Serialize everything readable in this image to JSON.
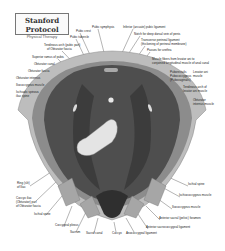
{
  "title": {
    "main": "Stanford Protocol",
    "sub": "Physical Therapy"
  },
  "labels": {
    "top": [
      {
        "text": "Pubic symphysis",
        "x": 92,
        "y": 27
      },
      {
        "text": "Inferior (arcuate) pubic ligament",
        "x": 123,
        "y": 27
      },
      {
        "text": "Pubic crest",
        "x": 76,
        "y": 31
      },
      {
        "text": "Pubic tubercle",
        "x": 70,
        "y": 37
      },
      {
        "text": "Notch for deep dorsal vein of penis",
        "x": 134,
        "y": 34
      },
      {
        "text": "Transverse perineal ligament",
        "x": 141,
        "y": 40
      },
      {
        "text": "(thickening of perineal membrane)",
        "x": 141,
        "y": 44
      },
      {
        "text": "Passes for urethra",
        "x": 147,
        "y": 50
      }
    ],
    "left": [
      {
        "text": "Tendinous arch (pubic part)",
        "x": 44,
        "y": 45
      },
      {
        "text": "of Obturator fascia",
        "x": 47,
        "y": 49
      },
      {
        "text": "Superior ramus of pubis",
        "x": 32,
        "y": 57
      },
      {
        "text": "Obturator canal",
        "x": 34,
        "y": 64
      },
      {
        "text": "Obturator fascia",
        "x": 28,
        "y": 71
      },
      {
        "text": "Obturator internus",
        "x": 16,
        "y": 78
      },
      {
        "text": "Iliococcygeus muscle",
        "x": 16,
        "y": 85
      },
      {
        "text": "Ischiadic spinous",
        "x": 16,
        "y": 92
      },
      {
        "text": "iliac spine",
        "x": 16,
        "y": 96
      }
    ],
    "right": [
      {
        "text": "Muscle fibers from levator ani to",
        "x": 152,
        "y": 59
      },
      {
        "text": "conjoined longitudinal muscle of anal canal",
        "x": 152,
        "y": 63
      },
      {
        "text": "Puborectalis",
        "x": 170,
        "y": 72
      },
      {
        "text": "Pubococcygeus",
        "x": 170,
        "y": 76
      },
      {
        "text": "(Pubovaginalis)",
        "x": 170,
        "y": 80
      },
      {
        "text": "Levator ani",
        "x": 193,
        "y": 72
      },
      {
        "text": "muscle",
        "x": 193,
        "y": 76
      },
      {
        "text": "Tendinous arch of",
        "x": 183,
        "y": 87
      },
      {
        "text": "levator ani muscle",
        "x": 183,
        "y": 91
      },
      {
        "text": "Obturator",
        "x": 193,
        "y": 100
      },
      {
        "text": "internus muscle",
        "x": 193,
        "y": 104
      }
    ],
    "bottom_left": [
      {
        "text": "Ring (slit)",
        "x": 17,
        "y": 183
      },
      {
        "text": "of Iliac",
        "x": 17,
        "y": 187
      },
      {
        "text": "Coccyx iliac",
        "x": 16,
        "y": 198
      },
      {
        "text": "(Obturator) part",
        "x": 16,
        "y": 202
      },
      {
        "text": "of Obturator fascia",
        "x": 16,
        "y": 206
      },
      {
        "text": "Ischial spine",
        "x": 34,
        "y": 214
      },
      {
        "text": "Coccygeal plexus",
        "x": 55,
        "y": 225
      }
    ],
    "bottom": [
      {
        "text": "Sacrum",
        "x": 70,
        "y": 232
      },
      {
        "text": "Sacral canal",
        "x": 86,
        "y": 233
      },
      {
        "text": "Coccyx",
        "x": 112,
        "y": 233
      },
      {
        "text": "Anococcygeal ligament",
        "x": 126,
        "y": 233
      }
    ],
    "bottom_right": [
      {
        "text": "Ischial spine",
        "x": 188,
        "y": 184
      },
      {
        "text": "Ischiococcygeus muscle",
        "x": 179,
        "y": 195
      },
      {
        "text": "Iliococcygeus muscle",
        "x": 172,
        "y": 207
      },
      {
        "text": "Anterior sacral (pelvic) foramen",
        "x": 159,
        "y": 218
      },
      {
        "text": "Anterior sacrococcygeal ligament",
        "x": 146,
        "y": 227
      }
    ]
  },
  "colors": {
    "background": "#ffffff",
    "outer_bone": "#b8b8b8",
    "pelvic_wall": "#8a8a8a",
    "muscle_dark": "#555555",
    "muscle_darker": "#3a3a3a",
    "organ_light": "#e6e6e6",
    "label_text": "#222222",
    "leader_line": "#444444"
  }
}
